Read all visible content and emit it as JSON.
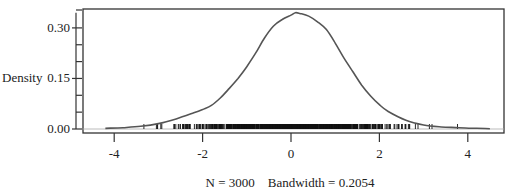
{
  "chart_data": {
    "type": "line",
    "title": "",
    "xlabel": "N = 3000    Bandwidth = 0.2054",
    "ylabel": "Density",
    "xlim": [
      -4.7,
      4.75
    ],
    "ylim": [
      -0.012,
      0.355
    ],
    "x_ticks": [
      -4,
      -2,
      0,
      2,
      4
    ],
    "x_tick_labels": [
      "-4",
      "-2",
      "0",
      "2",
      "4"
    ],
    "y_ticks": [
      0.0,
      0.15,
      0.3
    ],
    "y_tick_labels": [
      "0.00",
      "0.15",
      "0.30"
    ],
    "y_minor_ticks": [
      0.05,
      0.1,
      0.2,
      0.25
    ],
    "grid": false,
    "legend": null,
    "series": [
      {
        "name": "kernel density",
        "color": "#555555",
        "x": [
          -4.2,
          -3.8,
          -3.4,
          -3.0,
          -2.6,
          -2.2,
          -2.0,
          -1.8,
          -1.6,
          -1.4,
          -1.2,
          -1.0,
          -0.8,
          -0.6,
          -0.4,
          -0.2,
          0.0,
          0.1,
          0.2,
          0.4,
          0.6,
          0.8,
          1.0,
          1.2,
          1.4,
          1.6,
          1.8,
          2.0,
          2.2,
          2.6,
          3.0,
          3.4,
          3.8,
          4.2,
          4.5
        ],
        "values": [
          0.002,
          0.004,
          0.008,
          0.016,
          0.03,
          0.048,
          0.058,
          0.07,
          0.092,
          0.12,
          0.15,
          0.185,
          0.225,
          0.27,
          0.305,
          0.325,
          0.338,
          0.345,
          0.343,
          0.335,
          0.318,
          0.295,
          0.255,
          0.21,
          0.17,
          0.13,
          0.098,
          0.072,
          0.052,
          0.026,
          0.012,
          0.006,
          0.004,
          0.002,
          0.001
        ]
      }
    ],
    "rug": {
      "n": 3000,
      "range": [
        -3.7,
        3.9
      ],
      "description": "tick marks along x-axis at each observation, dense between -2 and 2"
    },
    "annotations": {
      "bandwidth": 0.2054,
      "n": 3000
    }
  },
  "labels": {
    "ylabel": "Density",
    "footer": "N = 3000    Bandwidth = 0.2054",
    "xticks": [
      "-4",
      "-2",
      "0",
      "2",
      "4"
    ],
    "yticks": [
      "0.00",
      "0.15",
      "0.30"
    ]
  }
}
